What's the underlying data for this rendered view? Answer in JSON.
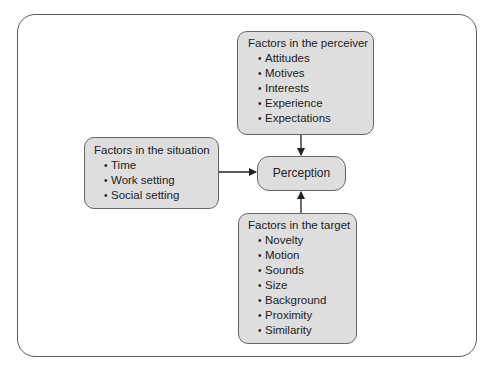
{
  "diagram": {
    "center": {
      "label": "Perception"
    },
    "perceiver": {
      "title": "Factors in the perceiver",
      "items": [
        "Attitudes",
        "Motives",
        "Interests",
        "Experience",
        "Expectations"
      ]
    },
    "situation": {
      "title": "Factors in the situation",
      "items": [
        "Time",
        "Work setting",
        "Social setting"
      ]
    },
    "target": {
      "title": "Factors in the target",
      "items": [
        "Novelty",
        "Motion",
        "Sounds",
        "Size",
        "Background",
        "Proximity",
        "Similarity"
      ]
    },
    "arrows": [
      {
        "from": "perceiver",
        "to": "center"
      },
      {
        "from": "situation",
        "to": "center"
      },
      {
        "from": "target",
        "to": "center"
      }
    ],
    "colors": {
      "box_fill": "#dedede",
      "box_border": "#666666",
      "frame_border": "#5a5a5a",
      "text": "#222222"
    }
  }
}
